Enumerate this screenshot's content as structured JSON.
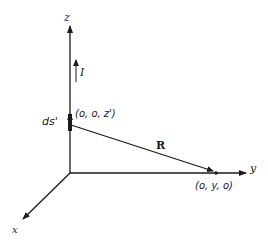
{
  "diagram": {
    "title": "",
    "axes": {
      "z_label": "z",
      "y_label": "y",
      "x_label": "x"
    },
    "current_label": "I",
    "source_element_label": "ds'",
    "source_point_label": "(o, o, z')",
    "field_point_label": "(o, y, o)",
    "separation_vector_label": "R",
    "colors": {
      "ink": "#1a1a1a",
      "background": "#ffffff"
    }
  }
}
